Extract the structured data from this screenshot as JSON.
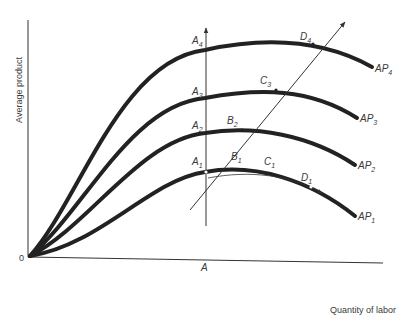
{
  "diagram": {
    "y_axis_label": "Average product",
    "x_axis_label": "Quantity of labor",
    "origin_label": "0",
    "x_marker_label": "A",
    "curves": [
      {
        "name": "AP",
        "sub": "1"
      },
      {
        "name": "AP",
        "sub": "2"
      },
      {
        "name": "AP",
        "sub": "3"
      },
      {
        "name": "AP",
        "sub": "4"
      }
    ],
    "points": {
      "A1": {
        "name": "A",
        "sub": "1"
      },
      "A2": {
        "name": "A",
        "sub": "2"
      },
      "A3": {
        "name": "A",
        "sub": "3"
      },
      "A4": {
        "name": "A",
        "sub": "4"
      },
      "B1": {
        "name": "B",
        "sub": "1"
      },
      "B2": {
        "name": "B",
        "sub": "2"
      },
      "C1": {
        "name": "C",
        "sub": "1"
      },
      "C3": {
        "name": "C",
        "sub": "3"
      },
      "D1": {
        "name": "D",
        "sub": "1"
      },
      "D4": {
        "name": "D",
        "sub": "4"
      }
    },
    "colors": {
      "curve": "#222222",
      "axis": "#333333",
      "text": "#3a3a3a",
      "background": "#ffffff"
    }
  }
}
